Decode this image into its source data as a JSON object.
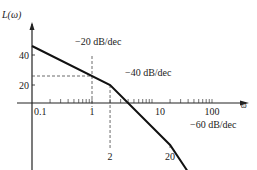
{
  "chart_data": {
    "type": "line",
    "title": "",
    "xlabel": "ω",
    "ylabel": "L(ω)",
    "xscale": "log",
    "xlim": [
      0.1,
      150
    ],
    "ylim": [
      -40,
      55
    ],
    "grid": false,
    "x_tick_labels": [
      "0.1",
      "1",
      "10",
      "100"
    ],
    "y_tick_labels": [
      "40",
      "20"
    ],
    "y_ticks": [
      40,
      20
    ],
    "series": [
      {
        "name": "asymptotic magnitude",
        "x": [
          0.1,
          2,
          20,
          40
        ],
        "y": [
          46,
          20,
          -20,
          -38
        ]
      }
    ],
    "guides": [
      {
        "type": "vertical",
        "x": 1,
        "label": ""
      },
      {
        "type": "vertical",
        "x": 2,
        "label": "2"
      },
      {
        "type": "vertical",
        "x": 20,
        "label": "20"
      },
      {
        "type": "horizontal",
        "y": 26,
        "label": ""
      }
    ],
    "annotations": [
      {
        "text": "−20 dB/dec",
        "segment": 1
      },
      {
        "text": "−40 dB/dec",
        "segment": 2
      },
      {
        "text": "−60 dB/dec",
        "segment": 3
      }
    ]
  }
}
